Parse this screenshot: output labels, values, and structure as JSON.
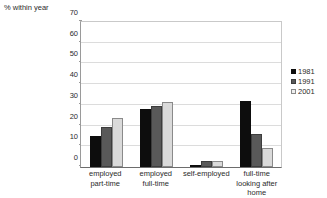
{
  "chart_data": {
    "type": "bar",
    "title": "",
    "subtitle": "",
    "ylabel": "% within year",
    "xlabel": "",
    "ylim": [
      0,
      70
    ],
    "ytick_step": 10,
    "yticks": [
      0,
      10,
      20,
      30,
      40,
      50,
      60,
      70
    ],
    "grid": true,
    "legend_position": "right",
    "categories": [
      "employed part-time",
      "employed full-time",
      "self-employed",
      "full-time looking after home"
    ],
    "category_lines": [
      [
        "employed",
        "part-time"
      ],
      [
        "employed",
        "full-time"
      ],
      [
        "self-employed"
      ],
      [
        "full-time",
        "looking after",
        "home"
      ]
    ],
    "series": [
      {
        "name": "1981",
        "color": "#0d0d0d",
        "values": [
          15,
          28,
          1,
          32
        ]
      },
      {
        "name": "1991",
        "color": "#595959",
        "values": [
          19.5,
          29.5,
          3,
          16
        ]
      },
      {
        "name": "2001",
        "color": "#dadada",
        "values": [
          23.5,
          31.5,
          3,
          9
        ]
      }
    ]
  },
  "legend": {
    "items": [
      {
        "label": "1981"
      },
      {
        "label": "1991"
      },
      {
        "label": "2001"
      }
    ]
  },
  "caption": {
    "fragment": "Table 4.1"
  }
}
